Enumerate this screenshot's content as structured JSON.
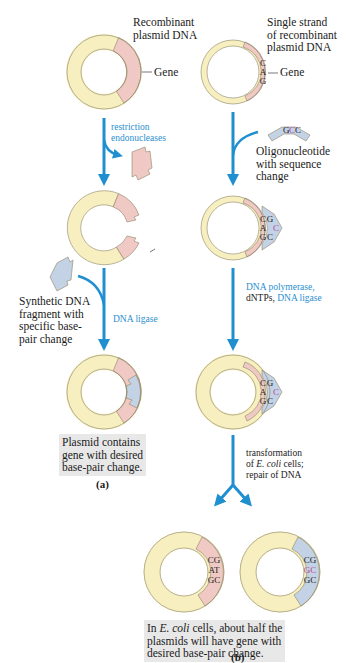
{
  "colors": {
    "vector": "#f7efc0",
    "gene": "#f0c9c4",
    "mutant": "#c4d2e6",
    "arrow": "#1f8fd0",
    "outline": "#8c8468",
    "caption_box": "#e8e8e8",
    "highlight_base": "#b0489a"
  },
  "panel_a": {
    "label": "(a)",
    "plasmid_label": "Recombinant\nplasmid DNA",
    "gene_label": "Gene",
    "step1": "restriction\nendonucleases",
    "fragment_label": "Synthetic DNA\nfragment with\nspecific base-\npair change",
    "step2": "DNA ligase",
    "result": "Plasmid contains\ngene with desired\nbase-pair change."
  },
  "panel_b": {
    "label": "(b)",
    "plasmid_label": "Single strand\nof recombinant\nplasmid DNA",
    "gene_label": "Gene",
    "template_bases": [
      "C",
      "A",
      "G"
    ],
    "oligo_bases": [
      "G",
      "C",
      "C"
    ],
    "oligo_label": "Oligonucleotide\nwith sequence\nchange",
    "step1_blue_a": "DNA polymerase,",
    "step1_black": "dNTPs, ",
    "step1_blue_b": "DNA ligase",
    "step2": "transformation\nof ",
    "step2_italic": "E. coli",
    "step2_rest": " cells;\nrepair of DNA",
    "result_left_pairs": [
      "CG",
      "AT",
      "GC"
    ],
    "result_right_pairs": [
      "CG",
      "GC",
      "GC"
    ],
    "result_prefix": "In ",
    "result_italic": "E. coli",
    "result_text": " cells, about half the\nplasmids will have gene with\ndesired base-pair change."
  }
}
